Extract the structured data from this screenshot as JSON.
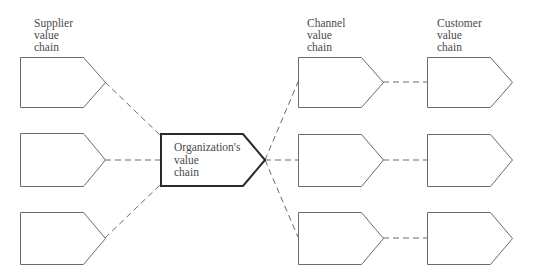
{
  "diagram": {
    "columns": {
      "supplier": {
        "label_lines": [
          "Supplier",
          "value",
          "chain"
        ]
      },
      "organization": {
        "label_lines": [
          "Organization's",
          "value",
          "chain"
        ]
      },
      "channel": {
        "label_lines": [
          "Channel",
          "value",
          "chain"
        ]
      },
      "customer": {
        "label_lines": [
          "Customer",
          "value",
          "chain"
        ]
      }
    },
    "nodes": [
      {
        "id": "supplier-1",
        "column": "supplier",
        "row": 1
      },
      {
        "id": "supplier-2",
        "column": "supplier",
        "row": 2
      },
      {
        "id": "supplier-3",
        "column": "supplier",
        "row": 3
      },
      {
        "id": "organization",
        "column": "organization",
        "row": 2,
        "emphasis": true
      },
      {
        "id": "channel-1",
        "column": "channel",
        "row": 1
      },
      {
        "id": "channel-2",
        "column": "channel",
        "row": 2
      },
      {
        "id": "channel-3",
        "column": "channel",
        "row": 3
      },
      {
        "id": "customer-1",
        "column": "customer",
        "row": 1
      },
      {
        "id": "customer-2",
        "column": "customer",
        "row": 2
      },
      {
        "id": "customer-3",
        "column": "customer",
        "row": 3
      }
    ],
    "edges": [
      {
        "from": "supplier-1",
        "to": "organization",
        "style": "dashed"
      },
      {
        "from": "supplier-2",
        "to": "organization",
        "style": "dashed"
      },
      {
        "from": "supplier-3",
        "to": "organization",
        "style": "dashed"
      },
      {
        "from": "organization",
        "to": "channel-1",
        "style": "dashed"
      },
      {
        "from": "organization",
        "to": "channel-2",
        "style": "dashed"
      },
      {
        "from": "organization",
        "to": "channel-3",
        "style": "dashed"
      },
      {
        "from": "channel-1",
        "to": "customer-1",
        "style": "dashed"
      },
      {
        "from": "channel-2",
        "to": "customer-2",
        "style": "dashed"
      },
      {
        "from": "channel-3",
        "to": "customer-3",
        "style": "dashed"
      }
    ],
    "colors": {
      "stroke": "#6a6a6a",
      "emphasis_stroke": "#2a2a2a",
      "text": "#4a4a4a",
      "background": "#ffffff"
    }
  }
}
